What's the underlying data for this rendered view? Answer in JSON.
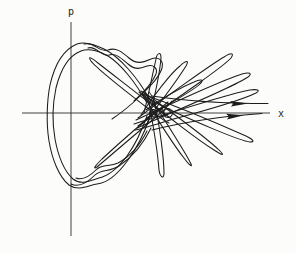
{
  "figure": {
    "width": 296,
    "height": 253,
    "ink_color": "#1c1c1c",
    "axis_color": "#2e2e2e",
    "paper_color": "#fcfcfa"
  },
  "axes": {
    "p_label": "p",
    "x_label": "x",
    "p_axis_path": "M 71 22 L 71 236",
    "x_axis_path": "M 22 113 L 270 113"
  },
  "curves": [
    {
      "name": "main-loop-outer",
      "d": "M 150 100 C 138 78 120 57 104 49 C 96 45 85 41 77 44 C 65 49 55 63 50 85 C 47 100 46 123 49 141 C 52 159 59 177 69 185 C 79 192 89 185 97 184 C 107 183 118 174 128 160 C 137 148 145 131 150 117"
    },
    {
      "name": "main-loop-inner",
      "d": "M 147 103 C 136 83 121 64 108 56 C 100 51 89 48 81 51 C 70 55 61 68 56 88 C 53 102 52 122 55 139 C 58 155 64 171 73 179 C 82 186 91 180 99 178 C 108 176 118 168 127 156 C 135 145 142 130 147 116"
    },
    {
      "name": "top-hook-outer",
      "d": "M 84 44 C 94 41 99 53 108 50 C 116 47 122 52 129 58 C 138 66 146 61 151 59 C 158 56 164 60 162 68 C 159 78 150 86 139 97 C 131 105 121 113 112 119"
    },
    {
      "name": "top-hook-inner",
      "d": "M 88 48 C 96 45 101 57 109 55 C 116 53 121 58 128 64 C 136 71 142 68 147 66 C 153 64 158 68 156 74 C 152 84 144 92 134 101"
    },
    {
      "name": "bottom-hook-outer",
      "d": "M 151 128 C 144 143 132 157 119 166 C 110 172 101 169 95 175 C 88 182 79 188 71 184"
    },
    {
      "name": "bottom-hook-inner",
      "d": "M 147 131 C 140 145 129 157 118 163 C 110 167 103 164 97 169 C 91 175 83 181 76 178"
    },
    {
      "name": "petal-upper-left",
      "d": "M 166 116 C 142 97 112 74 98 63 C 92 58 87 55 91 61 C 96 68 124 90 150 110 C 158 116 164 121 169 123"
    },
    {
      "name": "petal-upper-1",
      "d": "M 144 113 C 149 92 154 68 156 59 C 157 53 161 51 161 58 C 160 70 155 95 150 115 C 149 120 147 124 145 126"
    },
    {
      "name": "petal-upper-2",
      "d": "M 141 115 C 153 96 172 72 180 66 C 185 61 190 59 186 66 C 181 74 166 95 153 112 C 149 117 144 122 141 125"
    },
    {
      "name": "petal-upper-3",
      "d": "M 146 110 C 160 99 186 85 194 82 C 200 79 205 79 200 84 C 194 90 172 102 156 112 C 151 115 147 118 145 120"
    },
    {
      "name": "petal-upper-4",
      "d": "M 138 118 C 164 98 212 64 224 57 C 230 53 235 52 231 58 C 224 66 178 98 154 114 C 147 119 141 124 138 126"
    },
    {
      "name": "petal-upper-5",
      "d": "M 136 120 C 170 104 228 78 242 74 C 249 72 253 73 248 77 C 238 84 192 104 164 116 C 152 121 142 126 137 128"
    },
    {
      "name": "petal-upper-6",
      "d": "M 134 124 C 174 112 234 92 250 90 C 257 89 261 90 256 93 C 244 99 200 112 170 120 C 154 125 142 129 135 130"
    },
    {
      "name": "petal-lower-left",
      "d": "M 168 102 C 147 119 116 146 102 159 C 96 165 92 170 97 167 C 103 162 132 137 156 117 C 163 111 169 105 172 101"
    },
    {
      "name": "petal-lower-1",
      "d": "M 148 98 C 153 124 158 156 159 170 C 160 177 164 180 164 173 C 164 160 160 128 155 104 C 153 98 151 94 149 92"
    },
    {
      "name": "petal-lower-2",
      "d": "M 145 97 C 157 120 176 148 184 158 C 189 165 194 169 190 162 C 185 152 169 127 157 108 C 152 101 148 96 144 93"
    },
    {
      "name": "petal-lower-3",
      "d": "M 142 95 C 164 114 198 140 214 150 C 220 154 226 157 220 151 C 212 143 182 120 160 104 C 152 98 145 93 141 91"
    },
    {
      "name": "petal-lower-4",
      "d": "M 140 93 C 176 106 228 128 246 136 C 252 139 256 142 250 142 C 240 141 196 122 166 108 C 154 102 144 96 139 92"
    },
    {
      "name": "tangle-loop-1",
      "d": "M 153 109.5 a 3.5 3.5 0 1 0 0.01 0"
    },
    {
      "name": "tangle-loop-2",
      "d": "M 160 109 a 4 4 0 1 0 0.01 0"
    },
    {
      "name": "tangle-loop-3",
      "d": "M 168 108.5 a 4.5 4.5 0 1 0 0.01 0"
    },
    {
      "name": "escape-line-upper",
      "d": "M 152 96 C 185 101 228 103.5 268 103.5"
    },
    {
      "name": "escape-line-lower",
      "d": "M 152 130 C 188 121 226 116 262 113.5"
    }
  ],
  "arrows": [
    {
      "name": "escape-arrow-upper",
      "d": "M 248 103.6 L 230 100.9 L 233 103.8 L 231 106.4 Z"
    },
    {
      "name": "escape-arrow-lower",
      "d": "M 244 115.3 L 226 113.8 L 229 116.4 L 227 119.4 Z"
    }
  ]
}
